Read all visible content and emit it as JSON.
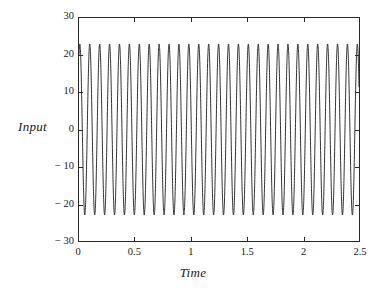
{
  "chart_data": {
    "type": "line",
    "title": "",
    "xlabel": "Time",
    "ylabel": "Input",
    "xlim": [
      0,
      2.5
    ],
    "ylim": [
      -30,
      30
    ],
    "xticks": [
      "0",
      "0.5",
      "1",
      "1.5",
      "2",
      "2.5"
    ],
    "xtick_values": [
      0,
      0.5,
      1,
      1.5,
      2,
      2.5
    ],
    "yticks": [
      "30",
      "20",
      "10",
      "0",
      "− 10",
      "− 20",
      "− 30"
    ],
    "ytick_values": [
      30,
      20,
      10,
      0,
      -10,
      -20,
      -30
    ],
    "grid": false,
    "legend": "none",
    "series": [
      {
        "name": "Input",
        "waveform": "sine",
        "amplitude": 23,
        "frequency_hz": 11.3,
        "phase_deg": 60,
        "offset": 0,
        "t_start": 0,
        "t_end": 2.5,
        "peak_value": 23,
        "trough_value": -23,
        "start_value": 20,
        "color": "#1a1a1a",
        "line_width": 0.9
      }
    ],
    "axis_color": "#2a2a2a",
    "background": "#ffffff"
  }
}
